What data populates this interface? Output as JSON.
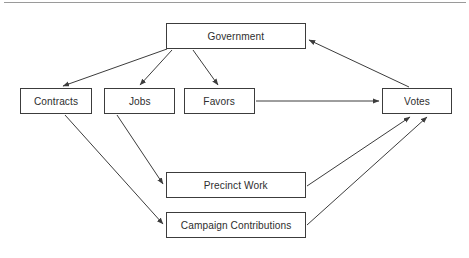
{
  "diagram": {
    "type": "flow-diagram",
    "colors": {
      "node_border": "#3c3c3c",
      "node_fill": "#ffffff",
      "edge_stroke": "#3c3c3c",
      "text": "#2e2e2e",
      "background": "#ffffff",
      "top_rule": "#9a9a9a"
    },
    "nodes": [
      {
        "id": "government",
        "label": "Government"
      },
      {
        "id": "contracts",
        "label": "Contracts"
      },
      {
        "id": "jobs",
        "label": "Jobs"
      },
      {
        "id": "favors",
        "label": "Favors"
      },
      {
        "id": "votes",
        "label": "Votes"
      },
      {
        "id": "precinct",
        "label": "Precinct Work"
      },
      {
        "id": "campaign",
        "label": "Campaign Contributions"
      }
    ],
    "edges": [
      {
        "from": "government",
        "to": "contracts",
        "label": ""
      },
      {
        "from": "government",
        "to": "jobs",
        "label": ""
      },
      {
        "from": "government",
        "to": "favors",
        "label": ""
      },
      {
        "from": "favors",
        "to": "votes",
        "label": ""
      },
      {
        "from": "jobs",
        "to": "precinct",
        "label": ""
      },
      {
        "from": "contracts",
        "to": "campaign",
        "label": ""
      },
      {
        "from": "precinct",
        "to": "votes",
        "label": ""
      },
      {
        "from": "campaign",
        "to": "votes",
        "label": ""
      },
      {
        "from": "votes",
        "to": "government",
        "label": ""
      }
    ]
  }
}
